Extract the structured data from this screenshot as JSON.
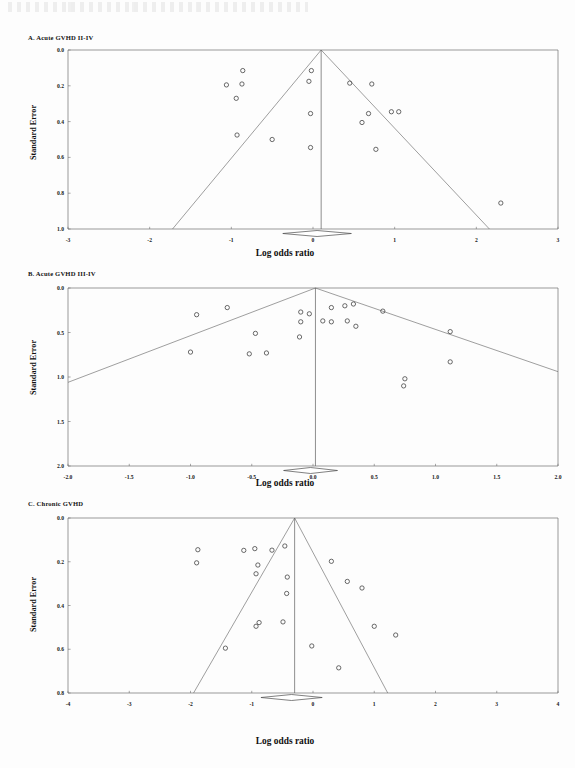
{
  "figure": {
    "axis_label_x": "Log odds ratio",
    "axis_label_y": "Standard Error"
  },
  "panels": {
    "a": {
      "title": "A. Acute GVHD II-IV"
    },
    "b": {
      "title": "B. Acute GVHD III-IV"
    },
    "c": {
      "title": "C. Chronic GVHD"
    }
  },
  "chart_data": [
    {
      "type": "scatter",
      "id": "panel-a",
      "title": "A. Acute GVHD II-IV",
      "xlabel": "Log odds ratio",
      "ylabel": "Standard Error",
      "xlim": [
        -3,
        3
      ],
      "ylim": [
        0,
        1
      ],
      "y_inverted": true,
      "grid": false,
      "legend": "none",
      "xticks": [
        -3,
        -2,
        -1,
        0,
        1,
        2,
        3
      ],
      "xtick_labels": [
        "-3",
        "-2",
        "-1",
        "0",
        "1",
        "2",
        "3"
      ],
      "yticks": [
        0.0,
        0.2,
        0.4,
        0.6,
        0.8,
        1.0
      ],
      "ytick_labels": [
        "0.0",
        "0.2",
        "0.4",
        "0.6",
        "0.8",
        "1.0"
      ],
      "funnel_apex": [
        0.1,
        0.0
      ],
      "funnel_slope_note": "95% pseudo confidence limits meeting apex at log odds ratio 0.1",
      "vertical_reference_x": 0.1,
      "summary_diamond": {
        "center_x": 0.05,
        "y": 1.0,
        "half_width": 0.42
      },
      "points": [
        {
          "x": -0.86,
          "y": 0.115
        },
        {
          "x": -1.06,
          "y": 0.195
        },
        {
          "x": -0.87,
          "y": 0.19
        },
        {
          "x": -0.94,
          "y": 0.27
        },
        {
          "x": -0.93,
          "y": 0.475
        },
        {
          "x": -0.5,
          "y": 0.5
        },
        {
          "x": -0.02,
          "y": 0.115
        },
        {
          "x": -0.05,
          "y": 0.175
        },
        {
          "x": -0.03,
          "y": 0.355
        },
        {
          "x": -0.03,
          "y": 0.545
        },
        {
          "x": 0.45,
          "y": 0.185
        },
        {
          "x": 0.72,
          "y": 0.19
        },
        {
          "x": 0.68,
          "y": 0.355
        },
        {
          "x": 0.96,
          "y": 0.345
        },
        {
          "x": 1.05,
          "y": 0.345
        },
        {
          "x": 0.6,
          "y": 0.405
        },
        {
          "x": 0.77,
          "y": 0.555
        },
        {
          "x": 2.3,
          "y": 0.855
        }
      ]
    },
    {
      "type": "scatter",
      "id": "panel-b",
      "title": "B. Acute GVHD III-IV",
      "xlabel": "Log odds ratio",
      "ylabel": "Standard Error",
      "xlim": [
        -2.0,
        2.0
      ],
      "ylim": [
        0,
        2.0
      ],
      "y_inverted": true,
      "grid": false,
      "legend": "none",
      "xticks": [
        -2.0,
        -1.5,
        -1.0,
        -0.5,
        0.0,
        0.5,
        1.0,
        1.5,
        2.0
      ],
      "xtick_labels": [
        "-2.0",
        "-1.5",
        "-1.0",
        "-0.5",
        "0.0",
        "0.5",
        "1.0",
        "1.5",
        "2.0"
      ],
      "yticks": [
        0.0,
        0.5,
        1.0,
        1.5,
        2.0
      ],
      "ytick_labels": [
        "0.0",
        "0.5",
        "1.0",
        "1.5",
        "2.0"
      ],
      "funnel_apex": [
        0.02,
        0.0
      ],
      "funnel_slope_note": "asymmetric pseudo confidence limits from apex",
      "vertical_reference_x": 0.02,
      "summary_diamond": {
        "center_x": -0.02,
        "y": 2.0,
        "half_width": 0.22
      },
      "points": [
        {
          "x": -0.95,
          "y": 0.3
        },
        {
          "x": -0.7,
          "y": 0.22
        },
        {
          "x": -1.0,
          "y": 0.72
        },
        {
          "x": -0.47,
          "y": 0.51
        },
        {
          "x": -0.52,
          "y": 0.74
        },
        {
          "x": -0.38,
          "y": 0.73
        },
        {
          "x": -0.1,
          "y": 0.27
        },
        {
          "x": -0.1,
          "y": 0.38
        },
        {
          "x": -0.11,
          "y": 0.55
        },
        {
          "x": -0.03,
          "y": 0.29
        },
        {
          "x": 0.08,
          "y": 0.37
        },
        {
          "x": 0.15,
          "y": 0.22
        },
        {
          "x": 0.15,
          "y": 0.38
        },
        {
          "x": 0.26,
          "y": 0.2
        },
        {
          "x": 0.28,
          "y": 0.37
        },
        {
          "x": 0.33,
          "y": 0.18
        },
        {
          "x": 0.35,
          "y": 0.43
        },
        {
          "x": 0.57,
          "y": 0.26
        },
        {
          "x": 0.75,
          "y": 1.02
        },
        {
          "x": 0.74,
          "y": 1.1
        },
        {
          "x": 1.12,
          "y": 0.83
        },
        {
          "x": 1.12,
          "y": 0.49
        }
      ]
    },
    {
      "type": "scatter",
      "id": "panel-c",
      "title": "C. Chronic GVHD",
      "xlabel": "Log odds ratio",
      "ylabel": "Standard Error",
      "xlim": [
        -4,
        4
      ],
      "ylim": [
        0,
        0.8
      ],
      "y_inverted": true,
      "grid": false,
      "legend": "none",
      "xticks": [
        -4,
        -3,
        -2,
        -1,
        0,
        1,
        2,
        3,
        4
      ],
      "xtick_labels": [
        "-4",
        "-3",
        "-2",
        "-1",
        "0",
        "1",
        "2",
        "3",
        "4"
      ],
      "yticks": [
        0.0,
        0.2,
        0.4,
        0.6,
        0.8
      ],
      "ytick_labels": [
        "0.0",
        "0.2",
        "0.4",
        "0.6",
        "0.8"
      ],
      "funnel_apex": [
        -0.3,
        0.0
      ],
      "funnel_slope_note": "95% pseudo confidence limits meeting apex near -0.3",
      "vertical_reference_x": -0.3,
      "summary_diamond": {
        "center_x": -0.35,
        "y": 0.8,
        "half_width": 0.5
      },
      "points": [
        {
          "x": -1.88,
          "y": 0.145
        },
        {
          "x": -1.9,
          "y": 0.205
        },
        {
          "x": -1.13,
          "y": 0.148
        },
        {
          "x": -0.95,
          "y": 0.14
        },
        {
          "x": -0.9,
          "y": 0.215
        },
        {
          "x": -0.93,
          "y": 0.255
        },
        {
          "x": -0.67,
          "y": 0.147
        },
        {
          "x": -0.46,
          "y": 0.128
        },
        {
          "x": -0.42,
          "y": 0.27
        },
        {
          "x": -0.43,
          "y": 0.345
        },
        {
          "x": -0.88,
          "y": 0.478
        },
        {
          "x": -0.93,
          "y": 0.495
        },
        {
          "x": -0.49,
          "y": 0.475
        },
        {
          "x": -1.43,
          "y": 0.595
        },
        {
          "x": 0.3,
          "y": 0.198
        },
        {
          "x": 0.56,
          "y": 0.29
        },
        {
          "x": 0.8,
          "y": 0.32
        },
        {
          "x": 1.0,
          "y": 0.495
        },
        {
          "x": 1.35,
          "y": 0.535
        },
        {
          "x": -0.02,
          "y": 0.585
        },
        {
          "x": 0.42,
          "y": 0.685
        }
      ]
    }
  ]
}
